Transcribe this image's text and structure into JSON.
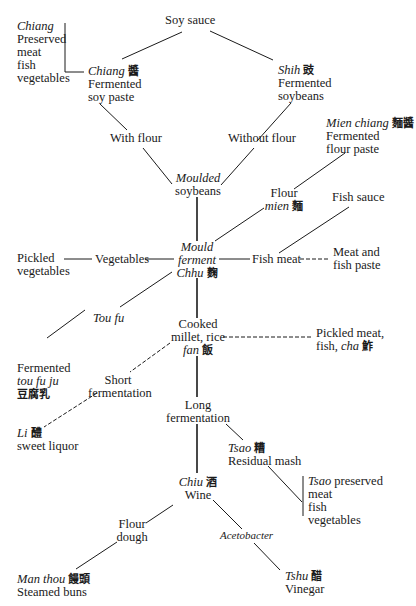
{
  "diagram": {
    "title": "",
    "nodes": {
      "soy_sauce": {
        "line1": "Soy sauce"
      },
      "chiang_preserved": {
        "italic": "Chiang",
        "line2": "Preserved",
        "line3": "meat",
        "line4": "fish",
        "line5": "vegetables"
      },
      "chiang": {
        "italic": "Chiang",
        "zh": "醬",
        "line2": "Fermented",
        "line3": "soy paste"
      },
      "shih": {
        "italic": "Shih",
        "zh": "豉",
        "line2": "Fermented",
        "line3": "soybeans"
      },
      "with_flour": {
        "line1": "With flour"
      },
      "without_flour": {
        "line1": "Without flour"
      },
      "mien_chiang": {
        "italic": "Mien chiang",
        "zh": "麵醬",
        "line2": "Fermented",
        "line3": "flour paste"
      },
      "moulded_soybeans": {
        "italic": "Moulded",
        "line2": "soybeans"
      },
      "flour_mien": {
        "line1": "Flour",
        "italic": "mien",
        "zh": "麵"
      },
      "fish_sauce": {
        "line1": "Fish sauce"
      },
      "pickled_vegetables": {
        "line1": "Pickled",
        "line2": "vegetables"
      },
      "vegetables": {
        "line1": "Vegetables"
      },
      "mould_ferment": {
        "italic1": "Mould",
        "italic2": "ferment",
        "italic3": "Chhu",
        "zh": "麴"
      },
      "fish_meat": {
        "line1": "Fish meat"
      },
      "meat_fish_paste": {
        "line1": "Meat and",
        "line2": "fish paste"
      },
      "tou_fu": {
        "italic": "Tou fu"
      },
      "cooked_millet": {
        "line1": "Cooked",
        "line2": "millet, rice",
        "italic": "fan",
        "zh": "飯"
      },
      "pickled_meat": {
        "line1": "Pickled meat,",
        "line2": "fish,",
        "italic": "cha",
        "zh": "鮓"
      },
      "fermented_toufuju": {
        "line1": "Fermented",
        "italic": "tou fu ju",
        "zh": "豆腐乳"
      },
      "short_fermentation": {
        "line1": "Short",
        "line2": "fermentation"
      },
      "li": {
        "italic": "Li",
        "zh": "醴",
        "line2": "sweet liquor"
      },
      "long_fermentation": {
        "line1": "Long",
        "line2": "fermentation"
      },
      "tsao": {
        "italic": "Tsao",
        "zh": "糟",
        "line2": "Residual mash"
      },
      "tsao_preserved": {
        "italic": "Tsao",
        "line1rest": "preserved",
        "line2": "meat",
        "line3": "fish",
        "line4": "vegetables"
      },
      "chiu": {
        "italic": "Chiu",
        "zh": "酒",
        "line2": "Wine"
      },
      "flour_dough": {
        "line1": "Flour",
        "line2": "dough"
      },
      "acetobacter": {
        "italic": "Acetobacter"
      },
      "man_thou": {
        "italic": "Man thou",
        "zh": "饅頭",
        "line2": "Steamed buns"
      },
      "tshu": {
        "italic": "Tshu",
        "zh": "醋",
        "line2": "Vinegar"
      }
    },
    "colors": {
      "line": "#1a1a1a",
      "text": "#1a1a1a",
      "background": "#ffffff"
    }
  }
}
